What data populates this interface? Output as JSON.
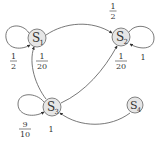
{
  "diagram": {
    "type": "markov-chain",
    "nodes": [
      {
        "id": "S1",
        "label": "S",
        "sub": "1",
        "cx": 37,
        "cy": 38
      },
      {
        "id": "S2",
        "label": "S",
        "sub": "2",
        "cx": 121,
        "cy": 37
      },
      {
        "id": "S3",
        "label": "S",
        "sub": "3",
        "cx": 52,
        "cy": 107
      },
      {
        "id": "S4",
        "label": "S",
        "sub": "4",
        "cx": 135,
        "cy": 105
      }
    ],
    "edges": [
      {
        "from": "S1",
        "to": "S1",
        "num": "1",
        "den": "2"
      },
      {
        "from": "S1",
        "to": "S2",
        "num": "1",
        "den": "2"
      },
      {
        "from": "S2",
        "to": "S2",
        "value": "1"
      },
      {
        "from": "S3",
        "to": "S1",
        "num": "1",
        "den": "20"
      },
      {
        "from": "S3",
        "to": "S2",
        "num": "1",
        "den": "20"
      },
      {
        "from": "S3",
        "to": "S3",
        "num": "9",
        "den": "10"
      },
      {
        "from": "S4",
        "to": "S3",
        "value": "1"
      }
    ],
    "labels": {
      "s1": {
        "main": "S",
        "sub": "1"
      },
      "s2": {
        "main": "S",
        "sub": "2"
      },
      "s3": {
        "main": "S",
        "sub": "3"
      },
      "s4": {
        "main": "S",
        "sub": "4"
      },
      "e_s1_s1": {
        "num": "1",
        "den": "2"
      },
      "e_s1_s2": {
        "num": "1",
        "den": "2"
      },
      "e_s2_s2": "1",
      "e_s3_s1": {
        "num": "1",
        "den": "20"
      },
      "e_s3_s2": {
        "num": "1",
        "den": "20"
      },
      "e_s3_s3": {
        "num": "9",
        "den": "10"
      },
      "e_s4_s3": "1"
    }
  }
}
